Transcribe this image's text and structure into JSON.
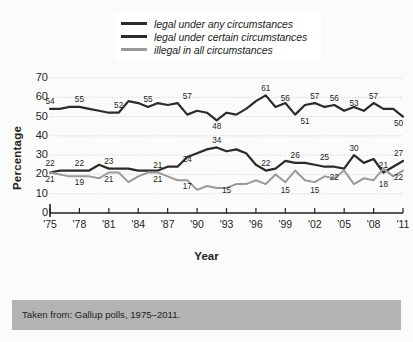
{
  "chart_data": {
    "type": "line",
    "title": "",
    "xlabel": "Year",
    "ylabel": "Percentage",
    "ylim": [
      0,
      70
    ],
    "ytick_labels": [
      "0",
      "10",
      "20",
      "30",
      "40",
      "50",
      "60",
      "70"
    ],
    "ytick_values": [
      0,
      10,
      20,
      30,
      40,
      50,
      60,
      70
    ],
    "xtick_labels": [
      "'75",
      "'78",
      "'81",
      "'84",
      "'87",
      "'90",
      "'93",
      "'96",
      "'99",
      "'02",
      "'05",
      "'08",
      "'11"
    ],
    "xtick_values": [
      1975,
      1978,
      1981,
      1984,
      1987,
      1990,
      1993,
      1996,
      1999,
      2002,
      2005,
      2008,
      2011
    ],
    "xlim": [
      1975,
      2011
    ],
    "grid": true,
    "legend_position": "top-center",
    "series": [
      {
        "name": "legal under any circumstances",
        "color": "#2b2b2b",
        "x": [
          1975,
          1976,
          1977,
          1978,
          1979,
          1980,
          1981,
          1982,
          1983,
          1984,
          1985,
          1986,
          1987,
          1988,
          1989,
          1990,
          1991,
          1992,
          1993,
          1994,
          1995,
          1996,
          1997,
          1998,
          1999,
          2000,
          2001,
          2002,
          2003,
          2004,
          2005,
          2006,
          2007,
          2008,
          2009,
          2010,
          2011
        ],
        "values": [
          21,
          22,
          22,
          22,
          22,
          25,
          23,
          23,
          23,
          22,
          22,
          22,
          24,
          24,
          29,
          31,
          33,
          34,
          32,
          33,
          31,
          25,
          22,
          23,
          27,
          26,
          26,
          25,
          24,
          24,
          23,
          30,
          26,
          28,
          21,
          24,
          27
        ],
        "labels": [
          {
            "x": 1975,
            "value": 22,
            "text": "22"
          },
          {
            "x": 1978,
            "value": 22,
            "text": "22"
          },
          {
            "x": 1981,
            "value": 23,
            "text": "23"
          },
          {
            "x": 1986,
            "value": 21,
            "text": "21"
          },
          {
            "x": 1989,
            "value": 24,
            "text": "24"
          },
          {
            "x": 1992,
            "value": 34,
            "text": "34"
          },
          {
            "x": 1997,
            "value": 22,
            "text": "22"
          },
          {
            "x": 2000,
            "value": 26,
            "text": "26"
          },
          {
            "x": 2003,
            "value": 25,
            "text": "25"
          },
          {
            "x": 2006,
            "value": 30,
            "text": "30"
          },
          {
            "x": 2009,
            "value": 21,
            "text": "21"
          },
          {
            "x": 2011,
            "value": 27,
            "text": "27"
          }
        ]
      },
      {
        "name": "legal under certain circumstances",
        "color": "#2b2b2b",
        "x": [
          1975,
          1976,
          1977,
          1978,
          1979,
          1980,
          1981,
          1982,
          1983,
          1984,
          1985,
          1986,
          1987,
          1988,
          1989,
          1990,
          1991,
          1992,
          1993,
          1994,
          1995,
          1996,
          1997,
          1998,
          1999,
          2000,
          2001,
          2002,
          2003,
          2004,
          2005,
          2006,
          2007,
          2008,
          2009,
          2010,
          2011
        ],
        "values": [
          54,
          54,
          55,
          55,
          54,
          53,
          52,
          52,
          58,
          57,
          55,
          57,
          56,
          57,
          51,
          53,
          52,
          48,
          52,
          51,
          54,
          58,
          61,
          55,
          57,
          51,
          56,
          57,
          55,
          56,
          53,
          55,
          53,
          57,
          54,
          54,
          50
        ],
        "labels": [
          {
            "x": 1975,
            "value": 54,
            "text": "54"
          },
          {
            "x": 1978,
            "value": 55,
            "text": "55"
          },
          {
            "x": 1982,
            "value": 52,
            "text": "52"
          },
          {
            "x": 1985,
            "value": 55,
            "text": "55"
          },
          {
            "x": 1989,
            "value": 57,
            "text": "57"
          },
          {
            "x": 1992,
            "value": 48,
            "text": "48"
          },
          {
            "x": 1997,
            "value": 61,
            "text": "61"
          },
          {
            "x": 1999,
            "value": 56,
            "text": "56"
          },
          {
            "x": 2001,
            "value": 51,
            "text": "51"
          },
          {
            "x": 2002,
            "value": 57,
            "text": "57"
          },
          {
            "x": 2004,
            "value": 56,
            "text": "56"
          },
          {
            "x": 2006,
            "value": 53,
            "text": "53"
          },
          {
            "x": 2008,
            "value": 57,
            "text": "57"
          },
          {
            "x": 2011,
            "value": 50,
            "text": "50"
          }
        ]
      },
      {
        "name": "illegal in all circumstances",
        "color": "#9a9a9a",
        "x": [
          1975,
          1976,
          1977,
          1978,
          1979,
          1980,
          1981,
          1982,
          1983,
          1984,
          1985,
          1986,
          1987,
          1988,
          1989,
          1990,
          1991,
          1992,
          1993,
          1994,
          1995,
          1996,
          1997,
          1998,
          1999,
          2000,
          2001,
          2002,
          2003,
          2004,
          2005,
          2006,
          2007,
          2008,
          2009,
          2010,
          2011
        ],
        "values": [
          21,
          20,
          19,
          19,
          19,
          18,
          21,
          21,
          16,
          19,
          21,
          21,
          19,
          17,
          17,
          12,
          14,
          13,
          13,
          15,
          15,
          17,
          15,
          20,
          16,
          22,
          17,
          16,
          19,
          18,
          22,
          15,
          18,
          17,
          23,
          19,
          22
        ],
        "labels": [
          {
            "x": 1975,
            "value": 21,
            "text": "21"
          },
          {
            "x": 1978,
            "value": 19,
            "text": "19"
          },
          {
            "x": 1981,
            "value": 21,
            "text": "21"
          },
          {
            "x": 1986,
            "value": 21,
            "text": "21"
          },
          {
            "x": 1989,
            "value": 17,
            "text": "17"
          },
          {
            "x": 1993,
            "value": 15,
            "text": "15"
          },
          {
            "x": 1999,
            "value": 15,
            "text": "15"
          },
          {
            "x": 2002,
            "value": 15,
            "text": "15"
          },
          {
            "x": 2004,
            "value": 22,
            "text": "22"
          },
          {
            "x": 2009,
            "value": 18,
            "text": "18"
          },
          {
            "x": 2011,
            "value": 22,
            "text": "22"
          }
        ]
      }
    ]
  },
  "legend": {
    "items": [
      {
        "label": "legal under any circumstances",
        "color": "#2b2b2b"
      },
      {
        "label": "legal under certain circumstances",
        "color": "#2b2b2b"
      },
      {
        "label": "illegal in all circumstances",
        "color": "#9a9a9a"
      }
    ]
  },
  "axes": {
    "y_title": "Percentage",
    "x_title": "Year"
  },
  "caption": {
    "text": "Taken from: Gallup polls, 1975–2011."
  },
  "colors": {
    "background": "#fbfbfb",
    "caption_band": "#b3b3b3",
    "gridline": "#cfcfcf",
    "axis": "#231f20",
    "series_dark": "#2b2b2b",
    "series_gray": "#9a9a9a"
  }
}
